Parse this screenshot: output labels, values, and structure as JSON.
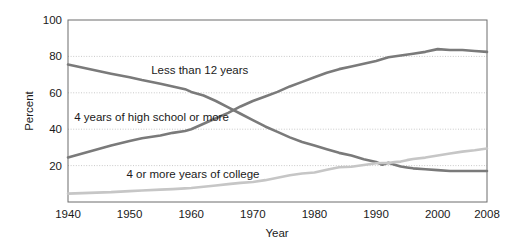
{
  "chart_data": {
    "type": "line",
    "title": "",
    "xlabel": "Year",
    "ylabel": "Percent",
    "xlim": [
      1940,
      2008
    ],
    "ylim": [
      0,
      100
    ],
    "xticks": [
      "1940",
      "1950",
      "1960",
      "1970",
      "1980",
      "1990",
      "2000",
      "2008"
    ],
    "xtick_values": [
      1940,
      1950,
      1960,
      1970,
      1980,
      1990,
      2000,
      2008
    ],
    "yticks": [
      "20",
      "40",
      "60",
      "80",
      "100"
    ],
    "ytick_values": [
      20,
      40,
      60,
      80,
      100
    ],
    "grid": "horizontal-dotted",
    "legend": "inline-labels",
    "series": [
      {
        "name": "Less than 12 years",
        "color": "#7a7a7a",
        "label_x": 1953.5,
        "label_y": 72.5,
        "x": [
          1940,
          1947,
          1950,
          1952,
          1955,
          1957,
          1959,
          1960,
          1962,
          1964,
          1966,
          1968,
          1970,
          1972,
          1974,
          1976,
          1978,
          1980,
          1982,
          1984,
          1986,
          1988,
          1990,
          1991,
          1992,
          1993,
          1994,
          1995,
          1996,
          1998,
          2000,
          2002,
          2004,
          2006,
          2008
        ],
        "y": [
          75.5,
          70.5,
          68.5,
          67.0,
          65.0,
          63.5,
          62.0,
          60.5,
          58.5,
          55.5,
          52.0,
          48.5,
          45.0,
          41.5,
          38.5,
          35.5,
          33.0,
          31.0,
          29.0,
          27.0,
          25.5,
          23.5,
          22.0,
          20.5,
          21.5,
          20.5,
          19.5,
          19.0,
          18.5,
          18.0,
          17.5,
          17.0,
          17.0,
          17.0,
          17.0
        ]
      },
      {
        "name": "4 years of high school or more",
        "color": "#7a7a7a",
        "label_x": 1941,
        "label_y": 46.5,
        "x": [
          1940,
          1947,
          1950,
          1952,
          1955,
          1957,
          1959,
          1960,
          1962,
          1964,
          1966,
          1968,
          1970,
          1972,
          1974,
          1976,
          1978,
          1980,
          1982,
          1984,
          1986,
          1988,
          1990,
          1992,
          1994,
          1996,
          1998,
          2000,
          2002,
          2004,
          2006,
          2008
        ],
        "y": [
          24.5,
          31.0,
          33.5,
          35.0,
          36.5,
          38.0,
          39.0,
          40.0,
          43.0,
          46.0,
          49.0,
          52.5,
          55.5,
          58.0,
          60.5,
          63.5,
          66.0,
          68.5,
          71.0,
          73.0,
          74.5,
          76.0,
          77.5,
          79.5,
          80.5,
          81.5,
          82.5,
          84.0,
          83.5,
          83.5,
          83.0,
          82.5
        ]
      },
      {
        "name": "4 or more years of college",
        "color": "#c6c6c6",
        "label_x": 1949.5,
        "label_y": 15.5,
        "x": [
          1940,
          1947,
          1950,
          1952,
          1955,
          1957,
          1959,
          1960,
          1962,
          1964,
          1966,
          1968,
          1970,
          1972,
          1974,
          1976,
          1978,
          1980,
          1982,
          1984,
          1986,
          1988,
          1990,
          1991,
          1992,
          1993,
          1994,
          1995,
          1996,
          1998,
          2000,
          2002,
          2004,
          2006,
          2008
        ],
        "y": [
          4.6,
          5.4,
          6.0,
          6.3,
          6.8,
          7.1,
          7.5,
          7.7,
          8.4,
          9.1,
          9.8,
          10.5,
          11.0,
          12.0,
          13.3,
          14.7,
          15.7,
          16.2,
          17.7,
          19.1,
          19.4,
          20.3,
          21.3,
          21.4,
          21.4,
          21.9,
          22.2,
          23.0,
          23.6,
          24.4,
          25.6,
          26.7,
          27.7,
          28.4,
          29.4
        ]
      }
    ]
  }
}
